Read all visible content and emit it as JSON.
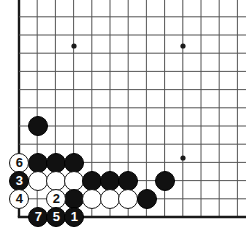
{
  "board": {
    "type": "go-board",
    "corner": "bottom-left",
    "background_color": "#ffffff",
    "line_color": "#555555",
    "edge_line_color": "#1a1a1a",
    "black_color": "#111111",
    "white_color": "#ffffff",
    "grid": {
      "origin_x": 19,
      "origin_y": 19,
      "spacing": 18.2,
      "cols": 13,
      "rows": 11,
      "left_edge_x": 19,
      "bottom_edge_y": 217
    },
    "star_points": [
      {
        "x": 74,
        "y": 46
      },
      {
        "x": 183,
        "y": 46
      },
      {
        "x": 183,
        "y": 158
      }
    ],
    "stone_radius": 10,
    "stones": [
      {
        "x": 38,
        "y": 126,
        "color": "black",
        "label": ""
      },
      {
        "x": 19,
        "y": 163,
        "color": "white",
        "label": "6"
      },
      {
        "x": 38,
        "y": 163,
        "color": "black",
        "label": ""
      },
      {
        "x": 56,
        "y": 163,
        "color": "black",
        "label": ""
      },
      {
        "x": 74,
        "y": 163,
        "color": "black",
        "label": ""
      },
      {
        "x": 19,
        "y": 181,
        "color": "black",
        "label": "3"
      },
      {
        "x": 38,
        "y": 181,
        "color": "white",
        "label": ""
      },
      {
        "x": 56,
        "y": 181,
        "color": "white",
        "label": ""
      },
      {
        "x": 74,
        "y": 181,
        "color": "white",
        "label": ""
      },
      {
        "x": 92,
        "y": 181,
        "color": "black",
        "label": ""
      },
      {
        "x": 110,
        "y": 181,
        "color": "black",
        "label": ""
      },
      {
        "x": 128,
        "y": 181,
        "color": "black",
        "label": ""
      },
      {
        "x": 165,
        "y": 181,
        "color": "black",
        "label": ""
      },
      {
        "x": 19,
        "y": 199,
        "color": "white",
        "label": "4"
      },
      {
        "x": 56,
        "y": 199,
        "color": "white",
        "label": "2"
      },
      {
        "x": 74,
        "y": 199,
        "color": "black",
        "label": ""
      },
      {
        "x": 92,
        "y": 199,
        "color": "white",
        "label": ""
      },
      {
        "x": 110,
        "y": 199,
        "color": "white",
        "label": ""
      },
      {
        "x": 128,
        "y": 199,
        "color": "white",
        "label": ""
      },
      {
        "x": 147,
        "y": 199,
        "color": "black",
        "label": ""
      },
      {
        "x": 38,
        "y": 217,
        "color": "black",
        "label": "7"
      },
      {
        "x": 56,
        "y": 217,
        "color": "black",
        "label": "5"
      },
      {
        "x": 74,
        "y": 217,
        "color": "black",
        "label": "1"
      }
    ],
    "move_numbers": [
      "1",
      "2",
      "3",
      "4",
      "5",
      "6",
      "7"
    ]
  }
}
